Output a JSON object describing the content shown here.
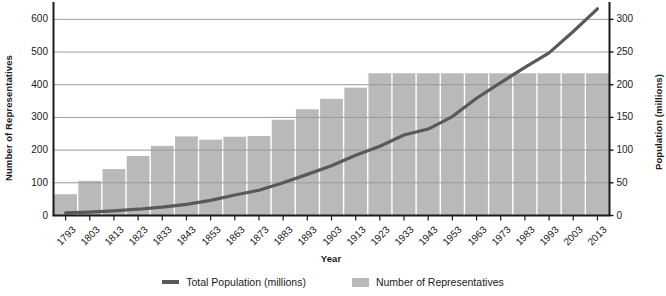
{
  "chart_data": {
    "type": "bar",
    "title": "",
    "xlabel": "Year",
    "ylabel": "Number of Representatives",
    "y2label": "Population (millions)",
    "grid": true,
    "legend_position": "bottom",
    "ylim": [
      0,
      650
    ],
    "y2lim": [
      0,
      325
    ],
    "yticks": [
      0,
      100,
      200,
      300,
      400,
      500,
      600
    ],
    "y2ticks": [
      0,
      50,
      100,
      150,
      200,
      250,
      300
    ],
    "categories": [
      "1793",
      "1803",
      "1813",
      "1823",
      "1833",
      "1843",
      "1853",
      "1863",
      "1873",
      "1883",
      "1893",
      "1903",
      "1913",
      "1923",
      "1933",
      "1943",
      "1953",
      "1963",
      "1973",
      "1983",
      "1993",
      "2003",
      "2013"
    ],
    "series": [
      {
        "name": "Number of Representatives",
        "type": "bar",
        "axis": "left",
        "color": "#b9b9b9",
        "values": [
          65,
          106,
          142,
          182,
          213,
          242,
          232,
          241,
          243,
          293,
          325,
          357,
          391,
          435,
          435,
          435,
          435,
          435,
          435,
          435,
          435,
          435,
          435
        ]
      },
      {
        "name": "Total Population (millions)",
        "type": "line",
        "axis": "right",
        "color": "#595959",
        "values": [
          3.9,
          5.3,
          7.2,
          9.6,
          12.9,
          17.1,
          23.2,
          31.4,
          38.6,
          50.2,
          62.9,
          76.2,
          92.2,
          106.0,
          123.2,
          132.2,
          151.3,
          179.3,
          203.3,
          226.5,
          248.7,
          281.4,
          316.1
        ]
      }
    ]
  },
  "legend": {
    "items": [
      {
        "label": "Total Population (millions)",
        "marker": "line",
        "color": "#595959"
      },
      {
        "label": "Number of Representatives",
        "marker": "box",
        "color": "#b9b9b9"
      }
    ]
  }
}
